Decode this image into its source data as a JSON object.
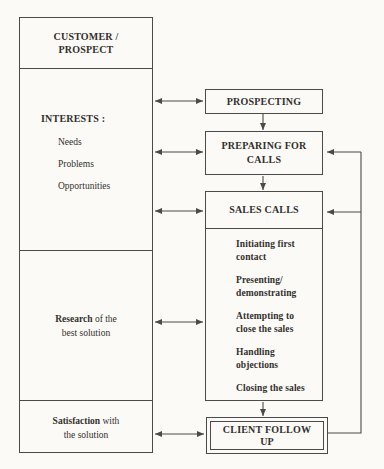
{
  "colors": {
    "background": "#fbfaf7",
    "ink": "#4a4a4a",
    "text": "#33302c"
  },
  "diagram": {
    "customer": {
      "title": "CUSTOMER /\nPROSPECT"
    },
    "interests": {
      "title": "INTERESTS :",
      "items": [
        "Needs",
        "Problems",
        "Opportunities"
      ]
    },
    "research": {
      "lead": "Research",
      "line1_rest": " of the",
      "line2": "best solution"
    },
    "satisfaction": {
      "lead": "Satisfaction",
      "line1_rest": " with",
      "line2": "the solution"
    },
    "prospecting": {
      "label": "PROSPECTING"
    },
    "preparing": {
      "label": "PREPARING FOR\nCALLS"
    },
    "sales_calls": {
      "title": "SALES CALLS",
      "steps": [
        "Initiating first\ncontact",
        "Presenting/\ndemonstrating",
        "Attempting to\nclose the sales",
        "Handling\nobjections",
        "Closing the sales"
      ]
    },
    "client_follow_up": {
      "label": "CLIENT FOLLOW\nUP"
    }
  }
}
